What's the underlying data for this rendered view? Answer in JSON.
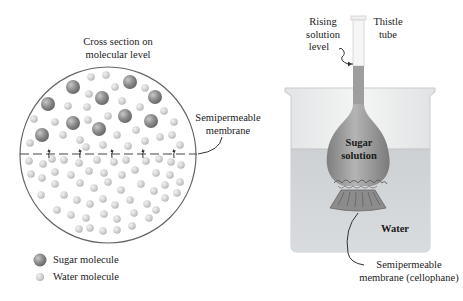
{
  "left_panel": {
    "title_line1": "Cross section on",
    "title_line2": "molecular level",
    "membrane_label_line1": "Semipermeable",
    "membrane_label_line2": "membrane",
    "legend": [
      {
        "label": "Sugar molecule",
        "icon": "sugar-molecule-icon"
      },
      {
        "label": "Water molecule",
        "icon": "water-molecule-icon"
      }
    ]
  },
  "right_panel": {
    "rising_label_line1": "Rising",
    "rising_label_line2": "solution",
    "rising_label_line3": "level",
    "tube_label_line1": "Thistle",
    "tube_label_line2": "tube",
    "bulb_label_line1": "Sugar",
    "bulb_label_line2": "solution",
    "water_label": "Water",
    "membrane_label_line1": "Semipermeable",
    "membrane_label_line2": "membrane (cellophane)"
  },
  "colors": {
    "sugar_molecule": "#8a8a8a",
    "water_molecule": "#d0d0d0",
    "beaker_water": "#cfd3d6",
    "solution": "#9a9a9a",
    "outline": "#555555"
  }
}
